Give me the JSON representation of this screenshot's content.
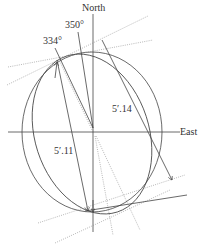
{
  "figure": {
    "type": "orbit-diagram",
    "labels": {
      "north": "North",
      "east": "East",
      "angle_a": "350°",
      "angle_b": "334°",
      "dist_a": "5′.14",
      "dist_b": "5′.11"
    },
    "colors": {
      "line": "#444444",
      "dotted": "#888888",
      "background": "#ffffff"
    }
  }
}
